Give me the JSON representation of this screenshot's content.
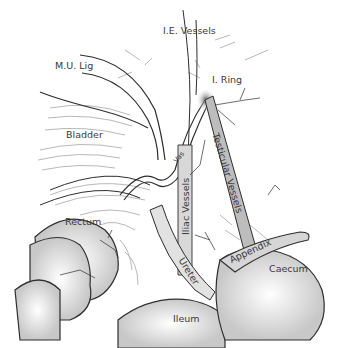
{
  "figure": {
    "type": "anatomical-illustration",
    "labels": {
      "ie_vessels": "I.E. Vessels",
      "mu_lig": "M.U. Lig",
      "i_ring": "I. Ring",
      "bladder": "Bladder",
      "vas": "Vas",
      "testicular_vessels": "Testicular Vessels",
      "iliac_vessels": "Iliac Vessels",
      "rectum": "Rectum",
      "ureter": "Ureter",
      "appendix": "Appendix",
      "caecum": "Caecum",
      "ileum": "Ileum"
    },
    "colors": {
      "line": "#2e2e2e",
      "shade": "#cfcfcf",
      "vessel_fill": "#bdbdbd",
      "text": "#3a3a3a"
    }
  }
}
